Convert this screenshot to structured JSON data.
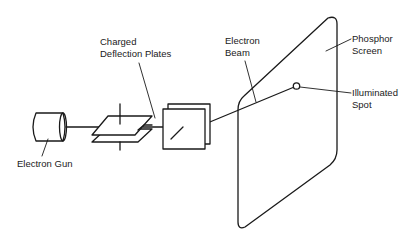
{
  "diagram": {
    "labels": {
      "electron_gun": "Electron Gun",
      "deflection_plates_line1": "Charged",
      "deflection_plates_line2": "Deflection Plates",
      "electron_beam_line1": "Electron",
      "electron_beam_line2": "Beam",
      "phosphor_screen_line1": "Phosphor",
      "phosphor_screen_line2": "Screen",
      "illuminated_spot_line1": "Illuminated",
      "illuminated_spot_line2": "Spot"
    },
    "colors": {
      "stroke": "#1a1a1a",
      "background": "#ffffff"
    }
  }
}
